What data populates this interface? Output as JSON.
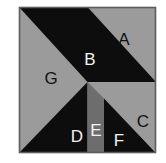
{
  "figure": {
    "name": "tangram-square-dissection",
    "canvas": {
      "width": 166,
      "height": 163
    },
    "square": {
      "x": 19,
      "y": 7,
      "width": 137,
      "height": 146
    },
    "colors": {
      "background": "#ffffff",
      "dark": "#0d0d0d",
      "light_gray": "#9b9b9b",
      "mid_gray": "#6d6d6d",
      "border": "#5d5d5d",
      "label_on_light": "#111111",
      "label_on_dark": "#f2f2f2"
    },
    "pieces": [
      {
        "id": "A",
        "label": "A",
        "shade": "light_gray",
        "points": "87.5,7 156,7 156,82",
        "label_x": 124,
        "label_y": 45,
        "label_color": "label_on_light"
      },
      {
        "id": "B",
        "label": "B",
        "shade": "dark",
        "points": "19,7 87.5,7 156,82 87.5,82",
        "label_x": 90,
        "label_y": 65,
        "label_color": "label_on_dark"
      },
      {
        "id": "C",
        "label": "C",
        "shade": "light_gray",
        "points": "120.5,115 156,115 156,153",
        "label_x": 143,
        "label_y": 121,
        "label_color": "label_on_light"
      },
      {
        "id": "D",
        "label": "D",
        "shade": "dark",
        "points": "87.5,82 87.5,153 19,153",
        "label_x": 77,
        "label_y": 136,
        "label_color": "label_on_dark"
      },
      {
        "id": "E",
        "label": "E",
        "shade": "mid_gray",
        "points": "87.5,82 104,98.5 104,153 87.5,153",
        "label_x": 100,
        "label_y": 130,
        "label_color": "label_on_dark"
      },
      {
        "id": "F",
        "label": "F",
        "shade": "dark",
        "points": "104,98.5 156,153 104,153",
        "label_x": 122,
        "label_y": 141,
        "label_color": "label_on_dark"
      },
      {
        "id": "G",
        "label": "G",
        "shade": "light_gray",
        "points": "19,7 87.5,82 19,153",
        "label_x": 51,
        "label_y": 78,
        "label_color": "label_on_light"
      }
    ]
  }
}
